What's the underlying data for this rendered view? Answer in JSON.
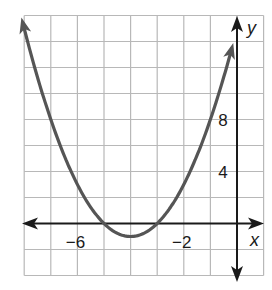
{
  "chart_data": {
    "type": "line",
    "title": "",
    "xlabel": "x",
    "ylabel": "y",
    "xlim": [
      -8.5,
      0.5
    ],
    "ylim": [
      -4,
      16
    ],
    "grid": true,
    "x_grid_step": 1,
    "y_grid_step": 2,
    "x_tick_labels": [
      {
        "value": -6,
        "label": "−6"
      },
      {
        "value": -2,
        "label": "−2"
      }
    ],
    "y_tick_labels": [
      {
        "value": 8,
        "label": "8"
      },
      {
        "value": 4,
        "label": "4"
      }
    ],
    "series": [
      {
        "name": "parabola",
        "equation": "y = (x + 4)^2 - 1",
        "vertex": [
          -4,
          -1
        ],
        "x_intercepts": [
          -5,
          -3
        ],
        "color": "#555555",
        "x": [
          -8.1,
          -8,
          -7,
          -6,
          -5,
          -4,
          -3,
          -2,
          -1,
          -0.2
        ],
        "values": [
          15.8,
          15,
          8,
          3,
          0,
          -1,
          0,
          3,
          8,
          13.4
        ],
        "arrows_both_ends": true
      }
    ]
  },
  "axes": {
    "x_label": "x",
    "y_label": "y",
    "axis_color": "#1a1a1a",
    "grid_color": "#b8b8b8",
    "curve_color": "#555555"
  }
}
